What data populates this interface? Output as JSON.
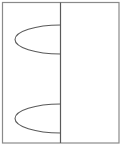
{
  "diagram": {
    "canvas": {
      "width": 122,
      "height": 149,
      "background": "#ffffff"
    },
    "outer_frame": {
      "x": 2.5,
      "y": 2.5,
      "width": 116.5,
      "height": 140.5,
      "stroke": "#8a8a8a",
      "stroke_width": 1.2
    },
    "divider": {
      "x": 60.5,
      "y1": 2.5,
      "y2": 143,
      "stroke": "#5a5a5a",
      "stroke_width": 1.2
    },
    "half_ellipses": [
      {
        "name": "upper",
        "attach_x": 60.5,
        "cy": 39.5,
        "rx": 45.5,
        "ry": 14.5,
        "stroke": "#5a5a5a"
      },
      {
        "name": "lower",
        "attach_x": 60.5,
        "cy": 118.5,
        "rx": 45.5,
        "ry": 14.5,
        "stroke": "#5a5a5a"
      }
    ],
    "labels": []
  }
}
